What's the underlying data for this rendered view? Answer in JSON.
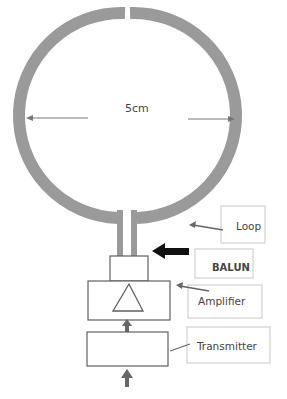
{
  "diagram": {
    "loop": {
      "dimension_label": "5cm",
      "color": "#999999"
    },
    "labels": {
      "loop": "Loop",
      "balun": "BALUN",
      "amplifier": "Amplifier",
      "transmitter": "Transmitter"
    },
    "colors": {
      "ring": "#9a9a9a",
      "box_stroke": "#606060",
      "label_box_stroke": "#c8c8c8",
      "arrow": "#666666",
      "balun_arrow": "#111111",
      "text": "#404040"
    },
    "caption": ""
  }
}
